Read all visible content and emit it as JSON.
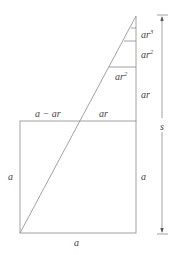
{
  "diagram": {
    "type": "geometric-construction",
    "colors": {
      "line": "#8a8a8a",
      "text": "#444444",
      "background": "#ffffff"
    },
    "labels": {
      "top_left_segment": "a − ar",
      "top_right_segment": "ar",
      "left_side": "a",
      "right_side": "a",
      "bottom_side": "a",
      "vertical_ar": "ar",
      "inner_ar2_base": "ar",
      "inner_ar2_exp": "2",
      "vertical_ar2_base": "ar",
      "vertical_ar2_exp": "2",
      "vertical_ar3_base": "ar",
      "vertical_ar3_exp": "3",
      "total_height": "s"
    }
  }
}
